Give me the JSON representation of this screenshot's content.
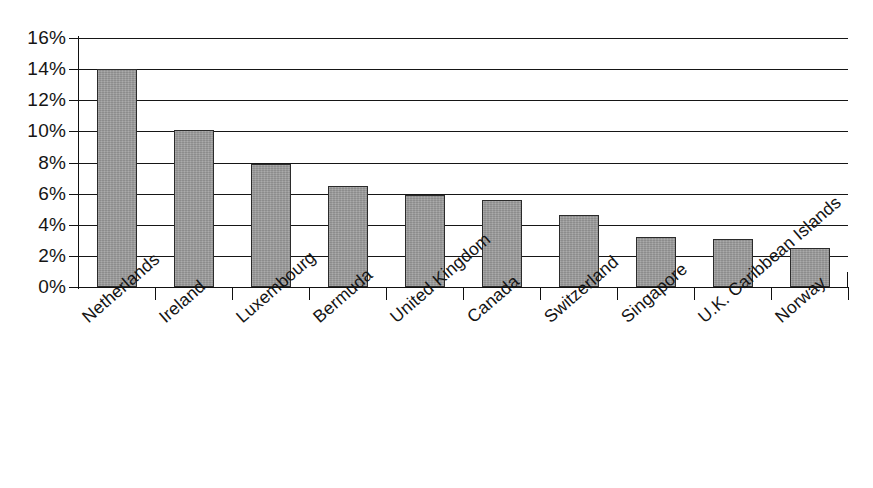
{
  "chart_data": {
    "type": "bar",
    "title": "",
    "subtitle": "",
    "xlabel": "",
    "ylabel": "",
    "categories": [
      "Netherlands",
      "Ireland",
      "Luxembourg",
      "Bermuda",
      "United Kingdom",
      "Canada",
      "Switzerland",
      "Singapore",
      "U.K. Caribbean Islands",
      "Norway"
    ],
    "values": [
      14.0,
      10.1,
      7.9,
      6.5,
      5.9,
      5.6,
      4.6,
      3.2,
      3.1,
      2.5
    ],
    "value_format": "percent",
    "ylim": [
      0,
      16
    ],
    "ytick_values": [
      0,
      2,
      4,
      6,
      8,
      10,
      12,
      14,
      16
    ],
    "ytick_labels": [
      "0%",
      "2%",
      "4%",
      "6%",
      "8%",
      "10%",
      "12%",
      "14%",
      "16%"
    ],
    "grid": true,
    "grid_axis": "y",
    "legend": false,
    "legend_position": "none",
    "series": [
      {
        "name": "",
        "values": [
          14.0,
          10.1,
          7.9,
          6.5,
          5.9,
          5.6,
          4.6,
          3.2,
          3.1,
          2.5
        ]
      }
    ],
    "colors": {
      "bar_fill": "#9a9a9a",
      "bar_border": "#2b2b2b",
      "gridline": "#161616",
      "axis": "#111111",
      "text": "#141414",
      "background": "#ffffff"
    }
  }
}
